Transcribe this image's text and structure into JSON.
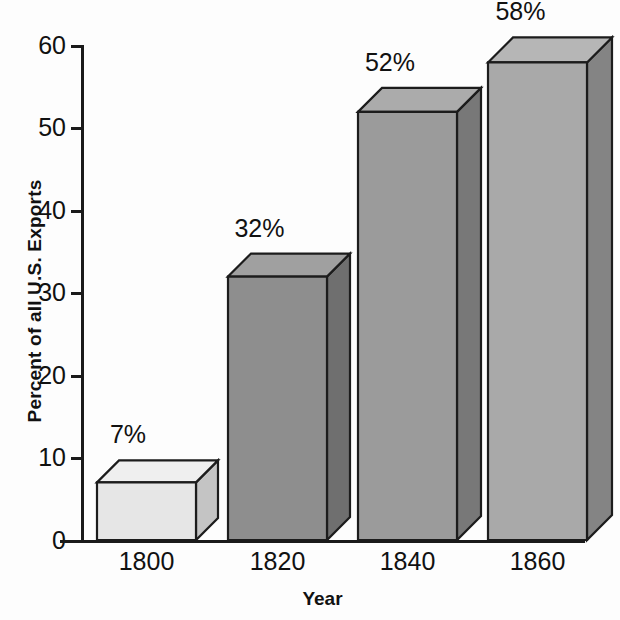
{
  "chart_data": {
    "type": "bar",
    "title": "",
    "subtitle": "",
    "xlabel": "Year",
    "ylabel": "Percent of all U.S. Exports",
    "categories": [
      "1800",
      "1820",
      "1840",
      "1860"
    ],
    "values": [
      7,
      32,
      52,
      58
    ],
    "data_labels": [
      "7%",
      "32%",
      "52%",
      "58%"
    ],
    "ylim": [
      0,
      60
    ],
    "ytick_labels": [
      "0",
      "10",
      "20",
      "30",
      "40",
      "50",
      "60"
    ],
    "ytick_values": [
      0,
      10,
      20,
      30,
      40,
      50,
      60
    ],
    "grid": false,
    "legend": false,
    "style": "3d-bars",
    "bar_colors": [
      "#e6e6e6",
      "#8e8e8e",
      "#9b9b9b",
      "#a9a9a9"
    ],
    "bar_top_colors": [
      "#efefef",
      "#a0a0a0",
      "#ababab",
      "#b6b6b6"
    ],
    "bar_side_colors": [
      "#c4c4c4",
      "#6f6f6f",
      "#787878",
      "#848484"
    ],
    "outline_color": "#1c1c1c",
    "axis_color": "#1a1a1a",
    "text_color": "#111111",
    "background_color": "#fdfdfd"
  }
}
